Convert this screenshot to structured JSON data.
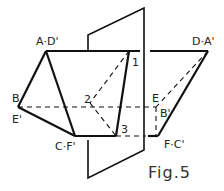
{
  "diagram": {
    "caption": "Fig.5",
    "labels": {
      "a_d": "A·D'",
      "d_a": "D·A'",
      "b": "B",
      "e_prime": "E'",
      "e": "E",
      "b_prime": "B'",
      "c_f": "C·F'",
      "f_c": "F·C'",
      "p1": "1",
      "p2": "2",
      "p3": "3"
    },
    "colors": {
      "stroke": "#111111",
      "background": "#ffffff"
    }
  }
}
